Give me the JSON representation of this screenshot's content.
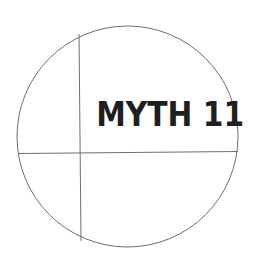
{
  "figure": {
    "title": "MYTH 11",
    "colors": {
      "line": "#6e6e6e",
      "text": "#1f1f1f",
      "background": "#ffffff"
    }
  }
}
